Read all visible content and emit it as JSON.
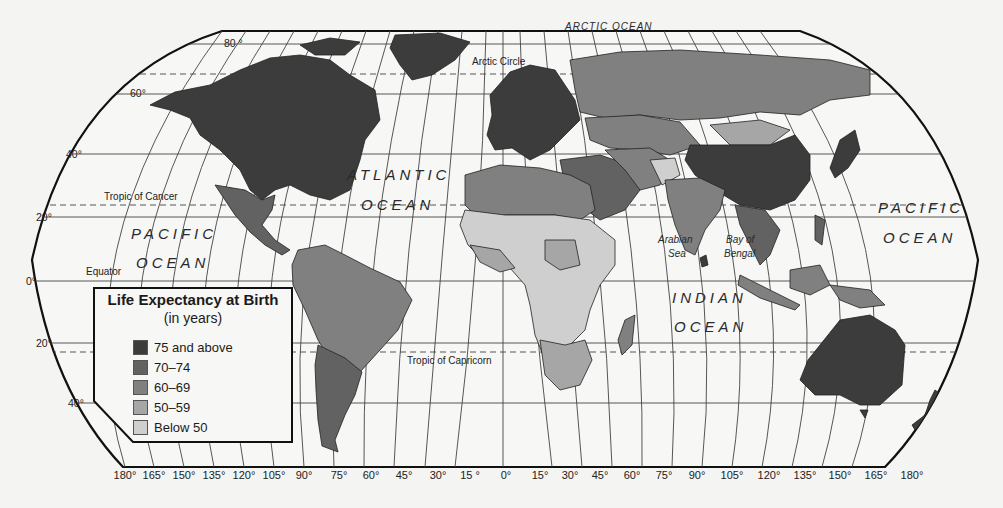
{
  "map": {
    "title": "Life Expectancy at Birth",
    "projection": "Robinson-style world map",
    "legend": {
      "title": "Life Expectancy at Birth",
      "subtitle": "(in years)",
      "items": [
        {
          "label": "75 and above",
          "color": "#3c3c3c"
        },
        {
          "label": "70–74",
          "color": "#626262"
        },
        {
          "label": "60–69",
          "color": "#808080"
        },
        {
          "label": "50–59",
          "color": "#a6a6a6"
        },
        {
          "label": "Below 50",
          "color": "#cfcfcf"
        }
      ]
    },
    "latitude_labels": {
      "lat80": "80 °",
      "lat60": "60°",
      "lat40": "40°",
      "lat20n": "20°",
      "lat0": "0°",
      "lat20s": "20°",
      "lat40s": "40°"
    },
    "longitude_labels": [
      "180°",
      "165°",
      "150°",
      "135°",
      "120°",
      "105°",
      "90°",
      "75°",
      "60°",
      "45°",
      "30°",
      "15 °",
      "0°",
      "15°",
      "30°",
      "45°",
      "60°",
      "75°",
      "90°",
      "105°",
      "120°",
      "135°",
      "150°",
      "165°",
      "180°"
    ],
    "reference_lines": {
      "arctic_circle": "Arctic Circle",
      "tropic_cancer": "Tropic of Cancer",
      "equator": "Equator",
      "tropic_capricorn": "Tropic of Capricorn"
    },
    "water_labels": {
      "arctic": "ARCTIC OCEAN",
      "atlantic_1": "ATLANTIC",
      "atlantic_2": "OCEAN",
      "pacific_w_1": "PACIFIC",
      "pacific_w_2": "OCEAN",
      "pacific_e_1": "PACIFIC",
      "pacific_e_2": "OCEAN",
      "indian_1": "INDIAN",
      "indian_2": "OCEAN",
      "arabian_1": "Arabian",
      "arabian_2": "Sea",
      "bengal_1": "Bay of",
      "bengal_2": "Bengal"
    },
    "regions": [
      {
        "name": "Canada / USA",
        "class": "75 and above"
      },
      {
        "name": "Greenland",
        "class": "75 and above"
      },
      {
        "name": "Mexico / Central America",
        "class": "70–74"
      },
      {
        "name": "Northern South America",
        "class": "60–69"
      },
      {
        "name": "Brazil",
        "class": "60–69"
      },
      {
        "name": "Argentina / Chile",
        "class": "70–74"
      },
      {
        "name": "Western Europe",
        "class": "75 and above"
      },
      {
        "name": "Russia",
        "class": "60–69"
      },
      {
        "name": "North Africa",
        "class": "60–69"
      },
      {
        "name": "Sub-Saharan Africa",
        "class": "Below 50"
      },
      {
        "name": "Southern Africa",
        "class": "50–59"
      },
      {
        "name": "Middle East",
        "class": "70–74"
      },
      {
        "name": "South Asia",
        "class": "60–69"
      },
      {
        "name": "China",
        "class": "75 and above"
      },
      {
        "name": "Mongolia",
        "class": "60–69"
      },
      {
        "name": "Southeast Asia",
        "class": "70–74"
      },
      {
        "name": "Japan",
        "class": "75 and above"
      },
      {
        "name": "Australia",
        "class": "75 and above"
      },
      {
        "name": "New Zealand",
        "class": "75 and above"
      },
      {
        "name": "Madagascar",
        "class": "60–69"
      }
    ]
  }
}
